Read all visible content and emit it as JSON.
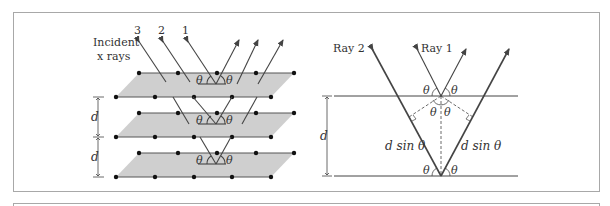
{
  "left_diagram": {
    "incident_label_line1": "Incident",
    "incident_label_line2": "x rays",
    "ray_numbers": [
      "3",
      "2",
      "1"
    ],
    "angle_symbol": "θ",
    "spacing_symbol": "d",
    "plane_fill": "#cfcfcf",
    "atom_color": "#111111"
  },
  "right_diagram": {
    "ray2_label": "Ray 2",
    "ray1_label": "Ray 1",
    "angle_symbol": "θ",
    "spacing_symbol": "d",
    "path_label_left": "d sin θ",
    "path_label_right": "d sin θ"
  },
  "colors": {
    "line": "#444444",
    "frame": "#a8a8a8"
  }
}
